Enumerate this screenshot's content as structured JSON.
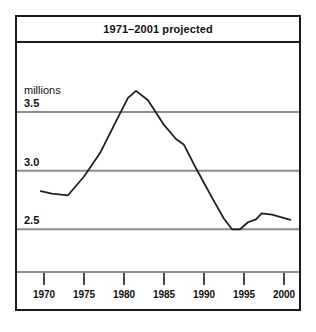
{
  "chart_data": {
    "type": "line",
    "title": "1971–2001 projected",
    "xlabel": "",
    "ylabel": "millions",
    "units_label": "millions",
    "xlim": [
      1969,
      2001.5
    ],
    "ylim": [
      2.0,
      3.72
    ],
    "grid": true,
    "gridlines_y": [
      3.5,
      3.0,
      2.5
    ],
    "legend": false,
    "ytick_labels": [
      "3.5",
      "3.0",
      "2.5",
      "2.0"
    ],
    "ytick_values": [
      3.5,
      3.0,
      2.5,
      2.0
    ],
    "xtick_labels": [
      "1970",
      "1975",
      "1980",
      "1985",
      "1990",
      "1995",
      "2000"
    ],
    "xtick_values": [
      1970,
      1975,
      1980,
      1985,
      1990,
      1995,
      2000
    ],
    "series": [
      {
        "name": "population",
        "color": "#231f20",
        "x": [
          1969.6,
          1971.0,
          1973.0,
          1975.0,
          1977.0,
          1979.0,
          1980.5,
          1981.5,
          1983.0,
          1985.0,
          1986.5,
          1987.5,
          1989.0,
          1991.0,
          1992.5,
          1993.5,
          1994.5,
          1995.5,
          1996.5,
          1997.2,
          1998.5,
          2000.8
        ],
        "y": [
          2.825,
          2.805,
          2.79,
          2.95,
          3.15,
          3.42,
          3.62,
          3.68,
          3.6,
          3.39,
          3.27,
          3.22,
          3.02,
          2.77,
          2.59,
          2.5,
          2.5,
          2.56,
          2.585,
          2.635,
          2.625,
          2.58
        ]
      }
    ]
  },
  "figure": {
    "background_color": "#ffffff",
    "frame_color": "#1a1a1a",
    "gridline_color": "#8c8c8c",
    "line_color": "#231f20"
  }
}
